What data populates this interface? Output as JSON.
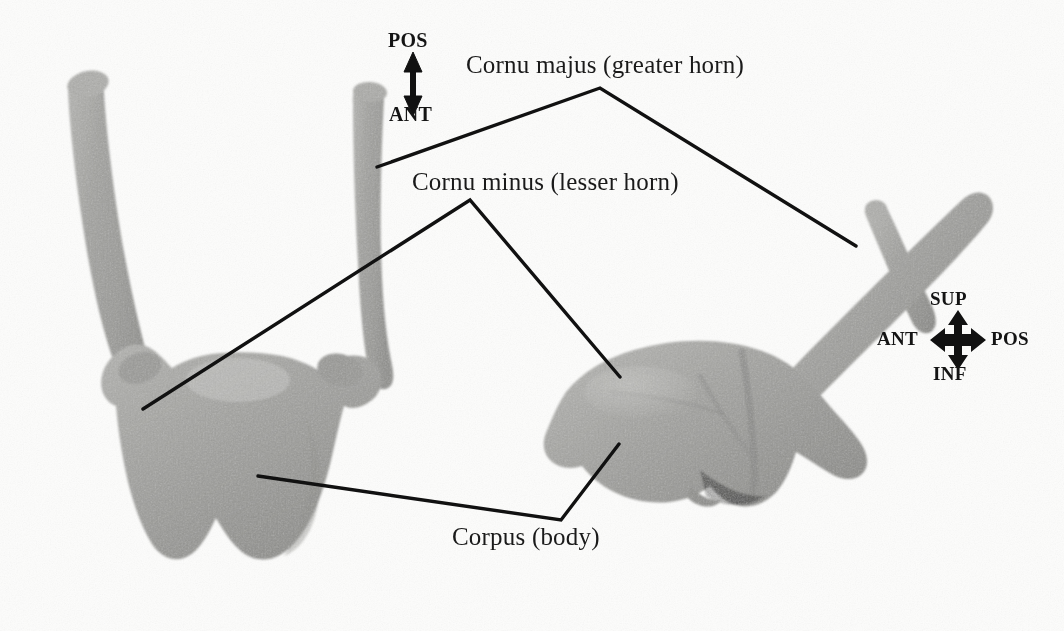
{
  "figure": {
    "background_color": "#fdfdfc",
    "bone_color": "#a3a3a0",
    "line_color": "#111111",
    "text_color": "#1a1a1a",
    "views": [
      {
        "name": "anterior-superior-view",
        "position": "left"
      },
      {
        "name": "lateral-view",
        "position": "right"
      }
    ]
  },
  "labels": {
    "cornu_majus": "Cornu majus (greater horn)",
    "cornu_minus": "Cornu minus (lesser horn)",
    "corpus": "Corpus (body)"
  },
  "orientation_left": {
    "name": "vertical-orientation-key",
    "up": "POS",
    "down": "ANT"
  },
  "orientation_right": {
    "name": "four-way-orientation-key",
    "up": "SUP",
    "down": "INF",
    "left": "ANT",
    "right": "POS"
  }
}
